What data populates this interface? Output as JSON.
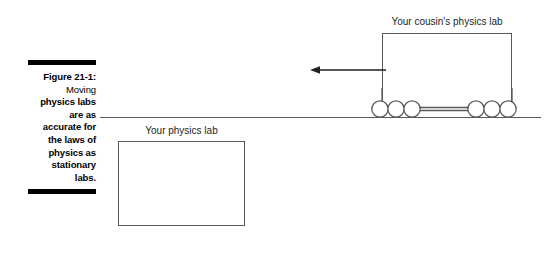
{
  "figure": {
    "label": "Figure 21-1:",
    "caption": "Moving physics labs are as accurate for the laws of physics as stationary labs.",
    "caption_lines": [
      "Moving",
      "physics labs",
      "are as",
      "accurate for",
      "the laws of",
      "physics as",
      "stationary",
      "labs."
    ]
  },
  "diagram": {
    "moving_lab_label": "Your cousin's physics lab",
    "stationary_lab_label": "Your physics lab",
    "arrow": {
      "name": "motion-arrow",
      "direction": "left",
      "meaning": "direction of motion"
    },
    "wheel_count": 6,
    "wheel_groups": [
      3,
      3
    ],
    "ground_label": ""
  },
  "colors": {
    "stroke": "#58595b",
    "text": "#231f20",
    "rule": "#000000",
    "background": "#ffffff"
  }
}
